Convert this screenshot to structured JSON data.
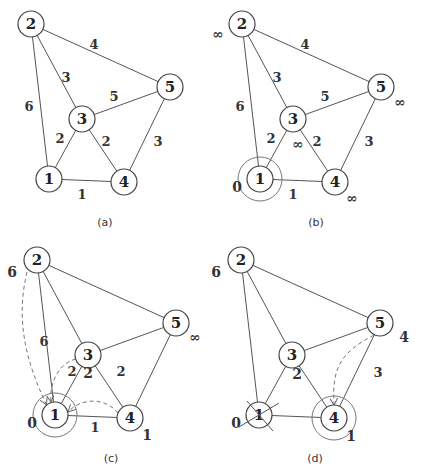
{
  "figure": {
    "nodes": [
      "1",
      "2",
      "3",
      "4",
      "5"
    ],
    "edges": [
      {
        "from": "1",
        "to": "2",
        "weight": "6"
      },
      {
        "from": "1",
        "to": "3",
        "weight": "2"
      },
      {
        "from": "1",
        "to": "4",
        "weight": "1"
      },
      {
        "from": "2",
        "to": "3",
        "weight": "3"
      },
      {
        "from": "2",
        "to": "5",
        "weight": "4"
      },
      {
        "from": "3",
        "to": "4",
        "weight": "2"
      },
      {
        "from": "3",
        "to": "5",
        "weight": "5"
      },
      {
        "from": "4",
        "to": "5",
        "weight": "3"
      }
    ],
    "panels": [
      {
        "id": "a",
        "caption": "(a)",
        "show_weights": [
          "1-2",
          "1-3",
          "1-4",
          "2-3",
          "2-5",
          "3-4",
          "3-5",
          "4-5"
        ],
        "distances": {},
        "ringed": [],
        "crossed": [],
        "arrows": []
      },
      {
        "id": "b",
        "caption": "(b)",
        "show_weights": [
          "1-2",
          "1-3",
          "1-4",
          "2-3",
          "2-5",
          "3-4",
          "3-5",
          "4-5"
        ],
        "distances": {
          "1": "0",
          "2": "∞",
          "3": "∞",
          "4": "∞",
          "5": "∞"
        },
        "ringed": [
          "1"
        ],
        "crossed": [],
        "arrows": []
      },
      {
        "id": "c",
        "caption": "(c)",
        "show_weights": [
          "1-2",
          "1-3",
          "1-4",
          "3-4"
        ],
        "distances": {
          "1": "0",
          "2": "6",
          "3": "2",
          "4": "1",
          "5": "∞"
        },
        "ringed": [
          "1"
        ],
        "crossed": [],
        "arrows": [
          [
            "2",
            "1"
          ],
          [
            "3",
            "1"
          ],
          [
            "4",
            "1"
          ]
        ]
      },
      {
        "id": "d",
        "caption": "(d)",
        "show_weights": [
          "4-5"
        ],
        "distances": {
          "1": "0",
          "2": "6",
          "3": "2",
          "4": "1",
          "5": "4"
        },
        "ringed": [
          "4"
        ],
        "crossed": [
          "1"
        ],
        "arrows": [
          [
            "5",
            "4"
          ]
        ]
      }
    ]
  }
}
